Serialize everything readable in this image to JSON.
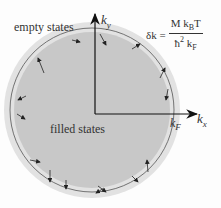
{
  "diagram": {
    "labels": {
      "empty_states": "empty states",
      "filled_states": "filled states",
      "ky_base": "k",
      "ky_sub": "y",
      "kx_base": "k",
      "kx_sub": "x",
      "kf_base": "k",
      "kf_sub": "F"
    },
    "formula": {
      "lhs": "δk =",
      "numerator": "M k",
      "numerator_sub": "B",
      "numerator_tail": "T",
      "denominator": "ħ",
      "denominator_sup": "2",
      "denominator_tail": " k",
      "denominator_sub": "F"
    },
    "colors": {
      "filled_disc": "#c8c8c8",
      "shell_band": "#e2e2e2",
      "fermi_circle": "#555555",
      "axes": "#111111",
      "arrows": "#222222",
      "background": "#fdfdfd"
    },
    "geometry": {
      "center": [
        92,
        110
      ],
      "filled_radius": 78,
      "shell_outer_radius": 88,
      "fermi_radius": 82
    }
  }
}
